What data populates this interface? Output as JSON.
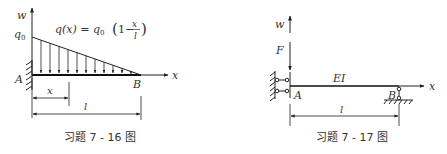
{
  "figures": [
    {
      "caption": "习题 7 - 16 图",
      "labels": {
        "w_axis": "w",
        "x_axis": "x",
        "q0": "q",
        "q0_sub": "0",
        "formula_lhs": "q(x) = q",
        "formula_sub": "0",
        "formula_open": "(1 −",
        "formula_num": "x",
        "formula_den": "l",
        "formula_close": ")",
        "point_A": "A",
        "point_B": "B",
        "dim_x": "x",
        "dim_l": "l"
      },
      "load": {
        "type": "linearly decreasing distributed load",
        "arrows": 12
      },
      "support_A": "fixed",
      "end_B": "free"
    },
    {
      "caption": "习题 7 - 17 图",
      "labels": {
        "w_axis": "w",
        "x_axis": "x",
        "force": "F",
        "stiffness": "EI",
        "point_A": "A",
        "point_B": "B",
        "dim_l": "l"
      },
      "support_A": "sliding (double link) clamp",
      "support_B": "roller/pin support"
    }
  ]
}
